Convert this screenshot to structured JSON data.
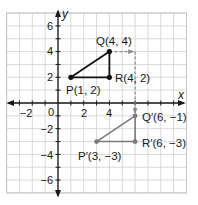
{
  "chart_data": {
    "type": "scatter",
    "title": "",
    "xlabel": "x",
    "ylabel": "y",
    "xlim": [
      -4,
      10
    ],
    "ylim": [
      -7,
      7
    ],
    "grid": true,
    "unit_px": 12.85,
    "origin_px": [
      58,
      103
    ],
    "x_ticks": [
      -2,
      0,
      2,
      4
    ],
    "x_tick_labels": [
      "−2",
      "0",
      "2",
      "4"
    ],
    "y_ticks": [
      6,
      4,
      2,
      -2,
      -4,
      -6
    ],
    "y_tick_labels": [
      "6",
      "4",
      "2",
      "−2",
      "−4",
      "−6"
    ],
    "series": [
      {
        "name": "Triangle PQR (preimage)",
        "color": "#111111",
        "points": [
          {
            "label": "P(1, 2)",
            "x": 1,
            "y": 2
          },
          {
            "label": "Q(4, 4)",
            "x": 4,
            "y": 4
          },
          {
            "label": "R(4, 2)",
            "x": 4,
            "y": 2
          }
        ]
      },
      {
        "name": "Triangle P'Q'R' (image)",
        "color": "#7a7a7a",
        "points": [
          {
            "label": "P′(3, −3)",
            "x": 3,
            "y": -3
          },
          {
            "label": "Q′(6, −1)",
            "x": 6,
            "y": -1
          },
          {
            "label": "R′(6, −3)",
            "x": 6,
            "y": -3
          }
        ]
      }
    ],
    "annotations": [
      {
        "type": "dashed-arrow",
        "from": [
          4,
          4
        ],
        "to": [
          6,
          4
        ],
        "color": "#888888",
        "meaning": "translate right 2"
      },
      {
        "type": "dashed-arrow",
        "from": [
          6,
          4
        ],
        "to": [
          6,
          -1
        ],
        "color": "#888888",
        "meaning": "translate down 5"
      }
    ]
  },
  "labels": {
    "x_axis": "x",
    "y_axis": "y",
    "P": "P(1, 2)",
    "Q": "Q(4, 4)",
    "R": "R(4, 2)",
    "P_prime": "P′(3, −3)",
    "Q_prime": "Q′(6, −1)",
    "R_prime": "R′(6, −3)",
    "tick_x_m2": "−2",
    "tick_x_0": "0",
    "tick_x_2": "2",
    "tick_x_4": "4",
    "tick_y_6": "6",
    "tick_y_4": "4",
    "tick_y_2": "2",
    "tick_y_m2": "−2",
    "tick_y_m4": "−4",
    "tick_y_m6": "−6"
  },
  "colors": {
    "preimage": "#111111",
    "image": "#7a7a7a",
    "arrow": "#888888",
    "grid": "#cfcfcf"
  }
}
